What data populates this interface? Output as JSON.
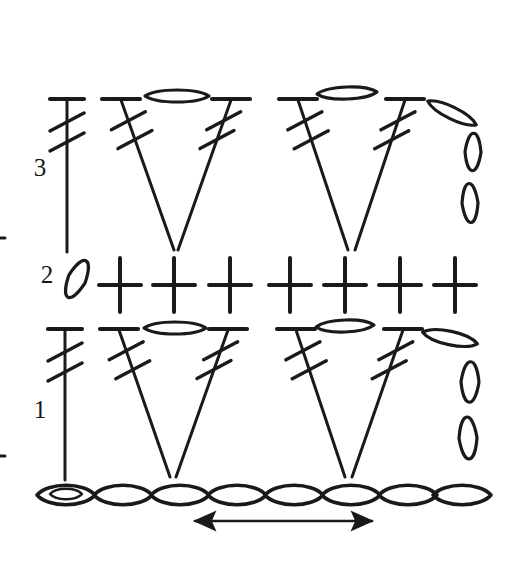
{
  "figure": {
    "kind": "crochet-symbol-chart",
    "width": 520,
    "height": 564,
    "background_color": "#ffffff",
    "ink_color": "#1a1a1a"
  },
  "row_labels": [
    {
      "text": "3",
      "x": 40,
      "y": 170
    },
    {
      "text": "2",
      "x": 47,
      "y": 277
    },
    {
      "text": "1",
      "x": 40,
      "y": 412
    }
  ],
  "legend_symbols": [
    {
      "name": "chain-stitch",
      "glyph": "oval-loop",
      "meaning": "chain (ch)"
    },
    {
      "name": "single-crochet",
      "glyph": "plus-cross",
      "meaning": "single crochet (sc)"
    },
    {
      "name": "double-treble-crochet",
      "glyph": "stem-with-top-bar-and-two-slashes",
      "meaning": "double treble crochet (dtr)"
    },
    {
      "name": "direction-arrow",
      "glyph": "double-headed-arrow",
      "meaning": "work direction"
    }
  ],
  "chart_data": {
    "type": "diagram",
    "rows": [
      {
        "row_number": "3",
        "label": "3",
        "stitch_counts": {
          "double_treble": 5,
          "chain": 5
        },
        "description": "Turning chain, then double treble stitches paired into V-shapes with chain loops between tops"
      },
      {
        "row_number": "2",
        "label": "2",
        "stitch_counts": {
          "single_crochet": 7,
          "chain": 1
        },
        "description": "Slanted turning chain followed by seven single crochet crosses"
      },
      {
        "row_number": "1",
        "label": "1",
        "stitch_counts": {
          "double_treble": 5,
          "chain": 5
        },
        "description": "Turning chain, then double treble stitches paired into V-shapes with chain loops between tops"
      },
      {
        "row_number": "foundation",
        "label": "",
        "stitch_counts": {
          "chain": 8
        },
        "description": "Foundation chain of eight loops, first loop contains the slip knot"
      }
    ],
    "arrow": {
      "name": "direction-arrow",
      "type": "double-headed",
      "x_start": 195,
      "x_end": 372,
      "y": 521
    }
  },
  "geometry": {
    "turning_chain_top": {
      "cx": 67,
      "cy": 70,
      "rx": 9,
      "ry": 26,
      "rotation": -12
    },
    "row3": {
      "top_y": 100,
      "stems": [
        {
          "name": "dtr-vertical",
          "x_top": 67,
          "x_bottom": 67,
          "y_bottom": 252,
          "bar_half": 17
        },
        {
          "name": "dtr-left-v1",
          "x_top": 121,
          "x_bottom": 174,
          "y_bottom": 250,
          "bar_half": 19
        },
        {
          "name": "dtr-right-v1",
          "x_top": 231,
          "x_bottom": 178,
          "y_bottom": 250,
          "bar_half": 19
        },
        {
          "name": "dtr-left-v2",
          "x_top": 298,
          "x_bottom": 348,
          "y_bottom": 250,
          "bar_half": 19
        },
        {
          "name": "dtr-right-v2",
          "x_top": 405,
          "x_bottom": 355,
          "y_bottom": 250,
          "bar_half": 19
        }
      ],
      "chain_ovals": [
        {
          "name": "ch-between-1",
          "cx": 177,
          "cy": 96,
          "rx": 32,
          "ry": 8,
          "rotation": 0
        },
        {
          "name": "ch-between-2",
          "cx": 347,
          "cy": 93,
          "rx": 30,
          "ry": 8,
          "rotation": -2
        }
      ],
      "edge_chains": [
        {
          "name": "ch-edge-diagonal",
          "cx": 452,
          "cy": 113,
          "rx": 27,
          "ry": 8,
          "rotation": 26
        },
        {
          "name": "ch-edge-upper",
          "cx": 473,
          "cy": 152,
          "rx": 8,
          "ry": 25,
          "rotation": 2
        },
        {
          "name": "ch-edge-lower",
          "cx": 470,
          "cy": 203,
          "rx": 8,
          "ry": 26,
          "rotation": -3
        }
      ]
    },
    "row2": {
      "center_y": 285,
      "turning_chain": {
        "cx": 77,
        "cy": 279,
        "rx": 9,
        "ry": 27,
        "rotation": 26
      },
      "sc_positions": [
        120,
        174,
        230,
        290,
        345,
        400,
        455
      ],
      "sc_arm_h": 21,
      "sc_arm_v": 27
    },
    "row1": {
      "top_y": 330,
      "stems": [
        {
          "name": "dtr-vertical",
          "x_top": 65,
          "x_bottom": 65,
          "y_bottom": 480,
          "bar_half": 17
        },
        {
          "name": "dtr-left-v1",
          "x_top": 119,
          "x_bottom": 170,
          "y_bottom": 477,
          "bar_half": 19
        },
        {
          "name": "dtr-right-v1",
          "x_top": 228,
          "x_bottom": 176,
          "y_bottom": 477,
          "bar_half": 19
        },
        {
          "name": "dtr-left-v2",
          "x_top": 296,
          "x_bottom": 345,
          "y_bottom": 477,
          "bar_half": 19
        },
        {
          "name": "dtr-right-v2",
          "x_top": 403,
          "x_bottom": 352,
          "y_bottom": 477,
          "bar_half": 19
        }
      ],
      "chain_ovals": [
        {
          "name": "ch-between-1",
          "cx": 175,
          "cy": 328,
          "rx": 31,
          "ry": 8,
          "rotation": 0
        },
        {
          "name": "ch-between-2",
          "cx": 345,
          "cy": 326,
          "rx": 29,
          "ry": 8,
          "rotation": -2
        }
      ],
      "edge_chains": [
        {
          "name": "ch-edge-diagonal",
          "cx": 450,
          "cy": 338,
          "rx": 28,
          "ry": 9,
          "rotation": 12
        },
        {
          "name": "ch-edge-upper",
          "cx": 470,
          "cy": 382,
          "rx": 9,
          "ry": 27,
          "rotation": 2
        },
        {
          "name": "ch-edge-lower",
          "cx": 468,
          "cy": 438,
          "rx": 9,
          "ry": 28,
          "rotation": -3
        }
      ]
    },
    "foundation": {
      "y": 495,
      "loop_rx": 29,
      "loop_ry": 13,
      "centers": [
        66,
        123,
        180,
        237,
        294,
        351,
        408,
        462
      ],
      "slip_knot": {
        "cx": 66,
        "cy": 494,
        "rx": 16,
        "ry": 7
      }
    },
    "edge_ticks": [
      {
        "name": "edge-tick-upper",
        "x1": 0,
        "y1": 238,
        "x2": 5,
        "y2": 238
      },
      {
        "name": "edge-tick-lower",
        "x1": 0,
        "y1": 456,
        "x2": 5,
        "y2": 456
      }
    ]
  }
}
